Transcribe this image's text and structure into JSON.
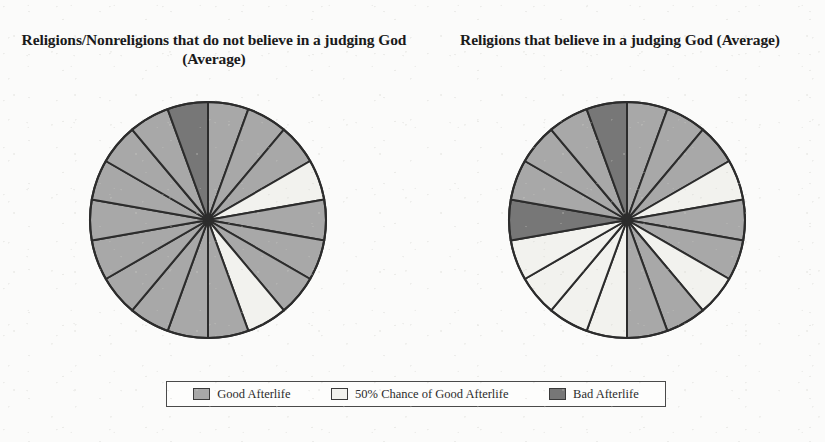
{
  "figure": {
    "background_color": "#fbfbfa",
    "ink_color": "#1a1a1a"
  },
  "titles": {
    "left": "Religions/Nonreligions that do not believe in a judging God (Average)",
    "right": "Religions that believe in a judging God (Average)"
  },
  "legend": {
    "position": "bottom",
    "items": [
      {
        "label": "Good Afterlife",
        "color": "#a8a8a8"
      },
      {
        "label": "50% Chance of Good Afterlife",
        "color": "#f2f2ee"
      },
      {
        "label": "Bad Afterlife",
        "color": "#777777"
      }
    ]
  },
  "chart_data": [
    {
      "type": "pie",
      "title": "Religions/Nonreligions that do not believe in a judging God (Average)",
      "categories": [
        "Good Afterlife",
        "50% Chance of Good Afterlife",
        "Bad Afterlife"
      ],
      "colors": [
        "#a8a8a8",
        "#f2f2ee",
        "#777777"
      ],
      "slice_count": 18,
      "slice_angle_deg": 20,
      "start_angle_deg": 0,
      "direction": "clockwise",
      "slice_categories": [
        "Good Afterlife",
        "Good Afterlife",
        "Good Afterlife",
        "50% Chance of Good Afterlife",
        "Good Afterlife",
        "Good Afterlife",
        "Good Afterlife",
        "50% Chance of Good Afterlife",
        "Good Afterlife",
        "Good Afterlife",
        "Good Afterlife",
        "Good Afterlife",
        "Good Afterlife",
        "Good Afterlife",
        "Good Afterlife",
        "Good Afterlife",
        "Good Afterlife",
        "Bad Afterlife"
      ],
      "values": [
        5.56,
        5.56,
        5.56,
        5.56,
        5.56,
        5.56,
        5.56,
        5.56,
        5.56,
        5.56,
        5.56,
        5.56,
        5.56,
        5.56,
        5.56,
        5.56,
        5.56,
        5.56
      ],
      "totals_percent": {
        "Good Afterlife": 83.3,
        "50% Chance of Good Afterlife": 11.1,
        "Bad Afterlife": 5.6
      }
    },
    {
      "type": "pie",
      "title": "Religions that believe in a judging God (Average)",
      "categories": [
        "Good Afterlife",
        "50% Chance of Good Afterlife",
        "Bad Afterlife"
      ],
      "colors": [
        "#a8a8a8",
        "#f2f2ee",
        "#777777"
      ],
      "slice_count": 18,
      "slice_angle_deg": 20,
      "start_angle_deg": 0,
      "direction": "clockwise",
      "slice_categories": [
        "Good Afterlife",
        "Good Afterlife",
        "Good Afterlife",
        "50% Chance of Good Afterlife",
        "Good Afterlife",
        "Good Afterlife",
        "50% Chance of Good Afterlife",
        "Good Afterlife",
        "Good Afterlife",
        "50% Chance of Good Afterlife",
        "50% Chance of Good Afterlife",
        "50% Chance of Good Afterlife",
        "50% Chance of Good Afterlife",
        "Bad Afterlife",
        "Good Afterlife",
        "Good Afterlife",
        "Good Afterlife",
        "Bad Afterlife"
      ],
      "values": [
        5.56,
        5.56,
        5.56,
        5.56,
        5.56,
        5.56,
        5.56,
        5.56,
        5.56,
        5.56,
        5.56,
        5.56,
        5.56,
        5.56,
        5.56,
        5.56,
        5.56,
        5.56
      ],
      "totals_percent": {
        "Good Afterlife": 55.6,
        "50% Chance of Good Afterlife": 33.3,
        "Bad Afterlife": 11.1
      }
    }
  ]
}
